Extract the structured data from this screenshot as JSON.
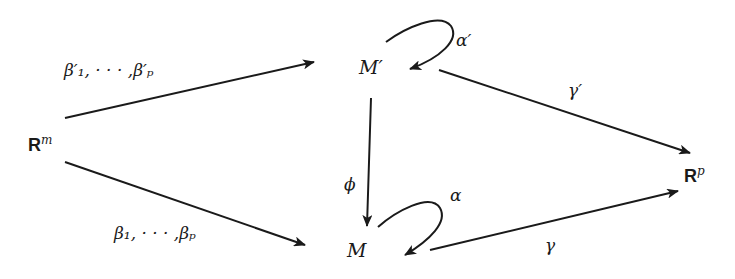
{
  "nodes": {
    "rm": {
      "base": "R",
      "sup": "m"
    },
    "rp": {
      "base": "R",
      "sup": "p"
    },
    "m_prime": {
      "label": "M′"
    },
    "m": {
      "label": "M"
    }
  },
  "edges": {
    "beta_prime": {
      "label": "β′₁, · · · ,β′ₚ",
      "from": "R^m",
      "to": "M′"
    },
    "beta": {
      "label": "β₁, · · · ,βₚ",
      "from": "R^m",
      "to": "M"
    },
    "phi": {
      "label": "ϕ",
      "from": "M′",
      "to": "M"
    },
    "alpha_prime": {
      "label": "α′",
      "from": "M′",
      "to": "M′"
    },
    "alpha": {
      "label": "α",
      "from": "M",
      "to": "M"
    },
    "gamma_prime": {
      "label": "γ′",
      "from": "M′",
      "to": "R^p"
    },
    "gamma": {
      "label": "γ",
      "from": "M",
      "to": "R^p"
    }
  },
  "colors": {
    "stroke": "#1a1a1a",
    "background": "#ffffff"
  }
}
